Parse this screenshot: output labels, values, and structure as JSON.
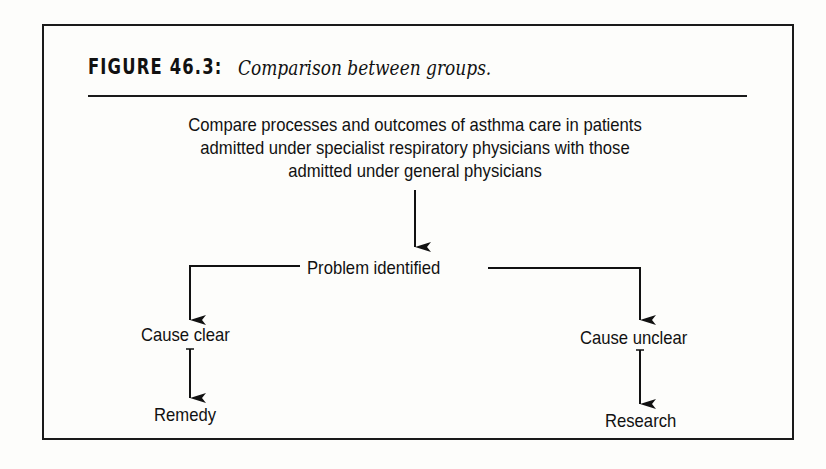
{
  "figure": {
    "label": "FIGURE 46.3:",
    "caption": "Comparison between groups."
  },
  "flowchart": {
    "root": {
      "lines": [
        "Compare processes and outcomes of asthma care in patients",
        "admitted under specialist respiratory physicians with those",
        "admitted under general physicians"
      ]
    },
    "decision": "Problem identified",
    "branches": [
      {
        "condition": "Cause clear",
        "outcome": "Remedy"
      },
      {
        "condition": "Cause unclear",
        "outcome": "Research"
      }
    ]
  }
}
